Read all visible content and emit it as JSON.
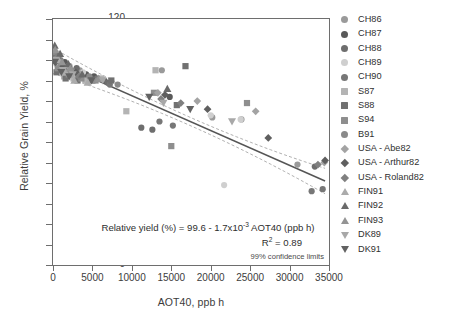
{
  "axes": {
    "ylabel": "Relative Grain Yield, %",
    "xlabel": "AOT40, ppb h",
    "yticks": [
      "120",
      "110",
      "100",
      "90",
      "80",
      "70",
      "60",
      "50",
      "40",
      "30",
      "20",
      "10",
      "0"
    ],
    "xticks": [
      "0",
      "5000",
      "10000",
      "15000",
      "20000",
      "25000",
      "30000",
      "35000"
    ]
  },
  "annotation": {
    "equation_pre": "Relative yield (%) = 99.6 - 1.7x10",
    "equation_exp": "-3",
    "equation_post": " AOT40 (ppb h)",
    "r2_pre": "R",
    "r2_exp": "2",
    "r2_post": " = 0.89",
    "ci_label": "99% confidence limits"
  },
  "legend": {
    "items": [
      {
        "label": "CH86",
        "shape": "circle",
        "color": "#9a9a9a"
      },
      {
        "label": "CH87",
        "shape": "circle",
        "color": "#595959"
      },
      {
        "label": "CH88",
        "shape": "circle",
        "color": "#6e6e6e"
      },
      {
        "label": "CH89",
        "shape": "circle",
        "color": "#cfcfcf"
      },
      {
        "label": "CH90",
        "shape": "circle",
        "color": "#777777"
      },
      {
        "label": "S87",
        "shape": "square",
        "color": "#b4b4b4"
      },
      {
        "label": "S88",
        "shape": "square",
        "color": "#717171"
      },
      {
        "label": "S94",
        "shape": "square",
        "color": "#8e8e8e"
      },
      {
        "label": "B91",
        "shape": "circle",
        "color": "#8a8a8a"
      },
      {
        "label": "USA - Abe82",
        "shape": "diamond",
        "color": "#a3a3a3"
      },
      {
        "label": "USA - Arthur82",
        "shape": "diamond",
        "color": "#5f5f5f"
      },
      {
        "label": "USA - Roland82",
        "shape": "diamond",
        "color": "#808080"
      },
      {
        "label": "FIN91",
        "shape": "tri-up",
        "color": "#ababab"
      },
      {
        "label": "FIN92",
        "shape": "tri-up",
        "color": "#6a6a6a"
      },
      {
        "label": "FIN93",
        "shape": "tri-up",
        "color": "#949494"
      },
      {
        "label": "DK89",
        "shape": "tri-down",
        "color": "#a8a8a8"
      },
      {
        "label": "DK91",
        "shape": "tri-down",
        "color": "#626262"
      }
    ]
  },
  "chart_data": {
    "type": "scatter",
    "title": "",
    "xlabel": "AOT40, ppb h",
    "ylabel": "Relative Grain Yield, %",
    "xlim": [
      0,
      35000
    ],
    "ylim": [
      0,
      120
    ],
    "grid": false,
    "legend_position": "right",
    "regression": {
      "intercept": 99.6,
      "slope": -0.0017,
      "r_squared": 0.89,
      "equation": "Relative yield (%) = 99.6 - 1.7x10^-3 AOT40 (ppb h)",
      "confidence_level": "99%",
      "x_start": 0,
      "x_end": 34500
    },
    "series": [
      {
        "name": "CH86",
        "shape": "circle",
        "color": "#9a9a9a",
        "points": [
          [
            300,
            102
          ],
          [
            600,
            99
          ],
          [
            1100,
            96
          ],
          [
            2100,
            97
          ],
          [
            3400,
            95
          ],
          [
            13800,
            95
          ],
          [
            20200,
            72
          ],
          [
            23900,
            71
          ],
          [
            31000,
            49
          ]
        ]
      },
      {
        "name": "CH87",
        "shape": "circle",
        "color": "#595959",
        "points": [
          [
            250,
            100
          ],
          [
            800,
            98
          ],
          [
            1500,
            99
          ],
          [
            2800,
            94
          ],
          [
            4200,
            93
          ],
          [
            5200,
            92
          ],
          [
            6500,
            90
          ],
          [
            14800,
            82
          ]
        ]
      },
      {
        "name": "CH88",
        "shape": "circle",
        "color": "#6e6e6e",
        "points": [
          [
            200,
            101
          ],
          [
            700,
            97
          ],
          [
            1700,
            95
          ],
          [
            3000,
            96
          ],
          [
            4800,
            91
          ],
          [
            6900,
            89
          ],
          [
            11200,
            67
          ],
          [
            12600,
            66
          ],
          [
            33200,
            48
          ]
        ]
      },
      {
        "name": "CH89",
        "shape": "circle",
        "color": "#cfcfcf",
        "points": [
          [
            400,
            98
          ],
          [
            1200,
            96
          ],
          [
            2300,
            93
          ],
          [
            3800,
            94
          ],
          [
            20000,
            73
          ],
          [
            23800,
            71
          ],
          [
            21700,
            39
          ]
        ]
      },
      {
        "name": "CH90",
        "shape": "circle",
        "color": "#777777",
        "points": [
          [
            350,
            103
          ],
          [
            950,
            100
          ],
          [
            1900,
            97
          ],
          [
            3200,
            92
          ],
          [
            5600,
            91
          ],
          [
            7200,
            88
          ],
          [
            13500,
            70
          ],
          [
            15200,
            68
          ],
          [
            34200,
            37
          ],
          [
            32800,
            36
          ]
        ]
      },
      {
        "name": "S87",
        "shape": "square",
        "color": "#b4b4b4",
        "points": [
          [
            500,
            99
          ],
          [
            1400,
            92
          ],
          [
            2600,
            91
          ],
          [
            4100,
            90
          ],
          [
            6100,
            91
          ],
          [
            9300,
            75
          ],
          [
            13000,
            95
          ]
        ]
      },
      {
        "name": "S88",
        "shape": "square",
        "color": "#717171",
        "points": [
          [
            450,
            94
          ],
          [
            1600,
            91
          ],
          [
            3100,
            90
          ],
          [
            5000,
            90
          ],
          [
            7400,
            90
          ],
          [
            16800,
            97
          ],
          [
            15700,
            78
          ]
        ]
      },
      {
        "name": "S94",
        "shape": "square",
        "color": "#8e8e8e",
        "points": [
          [
            600,
            96
          ],
          [
            2000,
            93
          ],
          [
            3600,
            91
          ],
          [
            5400,
            90
          ],
          [
            12800,
            84
          ],
          [
            24600,
            79
          ],
          [
            15000,
            58
          ]
        ]
      },
      {
        "name": "B91",
        "shape": "circle",
        "color": "#8a8a8a",
        "points": [
          [
            150,
            104
          ],
          [
            1000,
            98
          ],
          [
            2400,
            95
          ],
          [
            4600,
            92
          ],
          [
            8200,
            88
          ]
        ]
      },
      {
        "name": "USA - Abe82",
        "shape": "diamond",
        "color": "#a3a3a3",
        "points": [
          [
            550,
            100
          ],
          [
            1800,
            96
          ],
          [
            3500,
            93
          ],
          [
            13300,
            84
          ],
          [
            18300,
            80
          ],
          [
            25700,
            75
          ],
          [
            34400,
            50
          ]
        ]
      },
      {
        "name": "USA - Arthur82",
        "shape": "diamond",
        "color": "#5f5f5f",
        "points": [
          [
            320,
            99
          ],
          [
            1300,
            97
          ],
          [
            2900,
            94
          ],
          [
            14200,
            83
          ],
          [
            19600,
            76
          ],
          [
            27300,
            62
          ],
          [
            34500,
            51
          ]
        ]
      },
      {
        "name": "USA - Roland82",
        "shape": "diamond",
        "color": "#808080",
        "points": [
          [
            420,
            101
          ],
          [
            1500,
            95
          ],
          [
            3300,
            92
          ],
          [
            13700,
            81
          ],
          [
            16200,
            79
          ],
          [
            33600,
            49
          ]
        ]
      },
      {
        "name": "FIN91",
        "shape": "tri-up",
        "color": "#ababab",
        "points": [
          [
            180,
            106
          ],
          [
            700,
            100
          ],
          [
            1600,
            94
          ],
          [
            2700,
            90
          ],
          [
            4400,
            89
          ]
        ]
      },
      {
        "name": "FIN92",
        "shape": "tri-up",
        "color": "#6a6a6a",
        "points": [
          [
            220,
            107
          ],
          [
            900,
            103
          ],
          [
            1950,
            98
          ],
          [
            3700,
            93
          ],
          [
            14500,
            86
          ]
        ]
      },
      {
        "name": "FIN93",
        "shape": "tri-up",
        "color": "#949494",
        "points": [
          [
            280,
            105
          ],
          [
            1150,
            99
          ],
          [
            2200,
            96
          ],
          [
            5800,
            91
          ]
        ]
      },
      {
        "name": "DK89",
        "shape": "tri-down",
        "color": "#a8a8a8",
        "points": [
          [
            330,
            100
          ],
          [
            1250,
            95
          ],
          [
            2500,
            93
          ],
          [
            6300,
            90
          ],
          [
            14000,
            79
          ],
          [
            22700,
            70
          ]
        ]
      },
      {
        "name": "DK91",
        "shape": "tri-down",
        "color": "#626262",
        "points": [
          [
            260,
            99
          ],
          [
            1050,
            94
          ],
          [
            2050,
            92
          ],
          [
            4900,
            90
          ],
          [
            12200,
            82
          ],
          [
            17400,
            76
          ]
        ]
      }
    ]
  }
}
